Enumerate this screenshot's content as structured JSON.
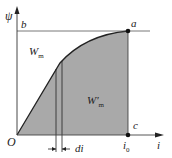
{
  "diagram": {
    "type": "magnetization-curve",
    "colors": {
      "fill": "#a9a9a9",
      "line": "#222222",
      "axis": "#333333"
    },
    "axes": {
      "y_label": "ψ",
      "x_label": "i"
    },
    "points": {
      "origin": "O",
      "a": "a",
      "b": "b",
      "c": "c",
      "i0": "i",
      "i0_sub": "0"
    },
    "regions": {
      "upper": "W",
      "upper_sub": "m",
      "lower": "W′",
      "lower_sub": "m"
    },
    "increment_label": "di"
  }
}
